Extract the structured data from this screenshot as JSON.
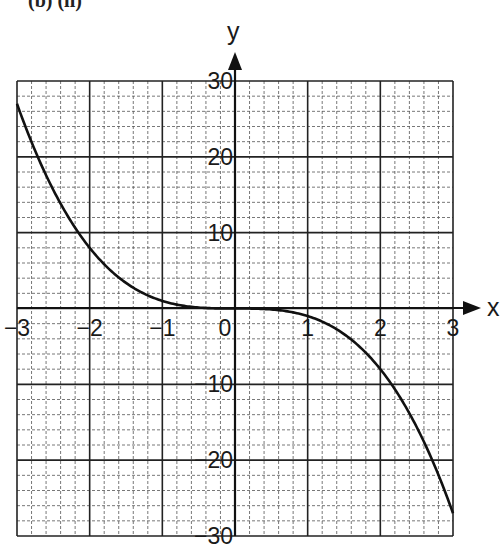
{
  "heading": "(b) (ii)",
  "chart_data": {
    "type": "line",
    "title": "",
    "xlabel": "x",
    "ylabel": "y",
    "xlim": [
      -3,
      3
    ],
    "ylim": [
      -30,
      30
    ],
    "grid": true,
    "grid_minor_divisions": 5,
    "x_ticks": [
      "-3",
      "-2",
      "-1",
      "0",
      "1",
      "2",
      "3"
    ],
    "y_ticks": [
      "30",
      "20",
      "10",
      "-10",
      "-20",
      "-30"
    ],
    "series": [
      {
        "name": "y = -x^3",
        "x": [
          -3,
          -2.5,
          -2,
          -1.5,
          -1,
          -0.5,
          0,
          0.5,
          1,
          1.5,
          2,
          2.5,
          3
        ],
        "y": [
          27,
          15.6,
          8,
          3.4,
          1,
          0.1,
          0,
          -0.1,
          -1,
          -3.4,
          -8,
          -15.6,
          -27
        ]
      }
    ],
    "colors": {
      "curve": "#111111",
      "major_grid": "#222222",
      "minor_grid": "#555555"
    }
  }
}
